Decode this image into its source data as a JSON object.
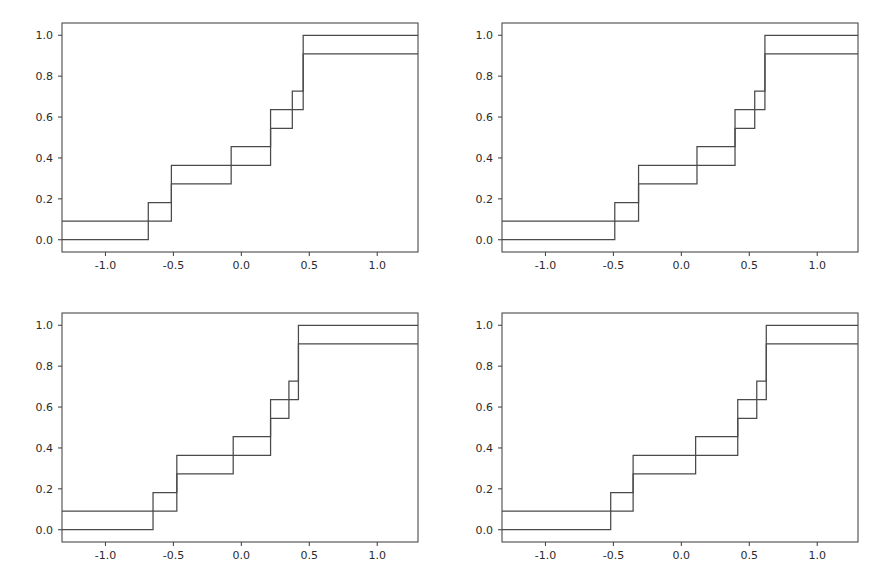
{
  "figure": {
    "background_color": "#ffffff",
    "layout": "2x2 grid of subplots",
    "panel_count": 4
  },
  "chart_data": [
    {
      "type": "line",
      "subtype": "step-ecdf",
      "panel_id": "top-left",
      "panel_position": [
        0,
        0
      ],
      "title": "",
      "xlabel": "",
      "ylabel": "",
      "xlim": [
        -1.32,
        1.3
      ],
      "ylim": [
        -0.06,
        1.06
      ],
      "xticks": [
        -1.0,
        -0.5,
        0.0,
        0.5,
        1.0
      ],
      "xticklabels": [
        "-1.0",
        "-0.5",
        "0.0",
        "0.5",
        "1.0"
      ],
      "yticks": [
        0.0,
        0.2,
        0.4,
        0.6,
        0.8,
        1.0
      ],
      "yticklabels": [
        "0.0",
        "0.2",
        "0.4",
        "0.6",
        "0.8",
        "1.0"
      ],
      "grid": false,
      "legend": "none",
      "series": [
        {
          "name": "ecdf-upper",
          "color": "#4a4a4a",
          "start_value": 0.091,
          "x": [
            -1.32,
            -0.685,
            -0.515,
            -0.075,
            0.215,
            0.375,
            0.455,
            1.3
          ],
          "y": [
            0.091,
            0.182,
            0.273,
            0.455,
            0.545,
            0.727,
            0.909,
            0.909
          ]
        },
        {
          "name": "ecdf-lower",
          "color": "#4a4a4a",
          "start_value": 0.0,
          "x": [
            -1.32,
            -0.685,
            -0.515,
            -0.075,
            0.215,
            0.375,
            0.455,
            1.3
          ],
          "y": [
            0.0,
            0.091,
            0.364,
            0.364,
            0.636,
            0.636,
            1.0,
            1.0
          ]
        }
      ],
      "step_x_positions": [
        -0.685,
        -0.515,
        -0.075,
        0.215,
        0.375,
        0.455
      ],
      "step_y_levels": [
        0.0,
        0.091,
        0.182,
        0.273,
        0.364,
        0.455,
        0.545,
        0.636,
        0.727,
        0.818,
        0.909,
        1.0
      ]
    },
    {
      "type": "line",
      "subtype": "step-ecdf",
      "panel_id": "top-right",
      "panel_position": [
        0,
        1
      ],
      "title": "",
      "xlabel": "",
      "ylabel": "",
      "xlim": [
        -1.32,
        1.3
      ],
      "ylim": [
        -0.06,
        1.06
      ],
      "xticks": [
        -1.0,
        -0.5,
        0.0,
        0.5,
        1.0
      ],
      "xticklabels": [
        "-1.0",
        "-0.5",
        "0.0",
        "0.5",
        "1.0"
      ],
      "yticks": [
        0.0,
        0.2,
        0.4,
        0.6,
        0.8,
        1.0
      ],
      "yticklabels": [
        "0.0",
        "0.2",
        "0.4",
        "0.6",
        "0.8",
        "1.0"
      ],
      "grid": false,
      "legend": "none",
      "series": [
        {
          "name": "ecdf-upper",
          "color": "#4a4a4a",
          "start_value": 0.091,
          "x": [
            -1.32,
            -0.49,
            -0.315,
            0.115,
            0.395,
            0.54,
            0.615,
            1.3
          ],
          "y": [
            0.091,
            0.182,
            0.273,
            0.455,
            0.545,
            0.727,
            0.909,
            0.909
          ]
        },
        {
          "name": "ecdf-lower",
          "color": "#4a4a4a",
          "start_value": 0.0,
          "x": [
            -1.32,
            -0.49,
            -0.315,
            0.115,
            0.395,
            0.54,
            0.615,
            1.3
          ],
          "y": [
            0.0,
            0.091,
            0.364,
            0.364,
            0.636,
            0.636,
            1.0,
            1.0
          ]
        }
      ],
      "step_x_positions": [
        -0.49,
        -0.315,
        0.115,
        0.395,
        0.54,
        0.615
      ],
      "step_y_levels": [
        0.0,
        0.091,
        0.182,
        0.273,
        0.364,
        0.455,
        0.545,
        0.636,
        0.727,
        0.818,
        0.909,
        1.0
      ]
    },
    {
      "type": "line",
      "subtype": "step-ecdf",
      "panel_id": "bottom-left",
      "panel_position": [
        1,
        0
      ],
      "title": "",
      "xlabel": "",
      "ylabel": "",
      "xlim": [
        -1.32,
        1.3
      ],
      "ylim": [
        -0.06,
        1.06
      ],
      "xticks": [
        -1.0,
        -0.5,
        0.0,
        0.5,
        1.0
      ],
      "xticklabels": [
        "-1.0",
        "-0.5",
        "0.0",
        "0.5",
        "1.0"
      ],
      "yticks": [
        0.0,
        0.2,
        0.4,
        0.6,
        0.8,
        1.0
      ],
      "yticklabels": [
        "0.0",
        "0.2",
        "0.4",
        "0.6",
        "0.8",
        "1.0"
      ],
      "grid": false,
      "legend": "none",
      "series": [
        {
          "name": "ecdf-upper",
          "color": "#4a4a4a",
          "start_value": 0.091,
          "x": [
            -1.32,
            -0.65,
            -0.475,
            -0.06,
            0.215,
            0.35,
            0.42,
            1.3
          ],
          "y": [
            0.091,
            0.182,
            0.273,
            0.455,
            0.545,
            0.727,
            0.909,
            0.909
          ]
        },
        {
          "name": "ecdf-lower",
          "color": "#4a4a4a",
          "start_value": 0.0,
          "x": [
            -1.32,
            -0.65,
            -0.475,
            -0.06,
            0.215,
            0.35,
            0.42,
            1.3
          ],
          "y": [
            0.0,
            0.091,
            0.364,
            0.364,
            0.636,
            0.636,
            1.0,
            1.0
          ]
        }
      ],
      "step_x_positions": [
        -0.65,
        -0.475,
        -0.06,
        0.215,
        0.35,
        0.42
      ],
      "step_y_levels": [
        0.0,
        0.091,
        0.182,
        0.273,
        0.364,
        0.455,
        0.545,
        0.636,
        0.727,
        0.818,
        0.909,
        1.0
      ]
    },
    {
      "type": "line",
      "subtype": "step-ecdf",
      "panel_id": "bottom-right",
      "panel_position": [
        1,
        1
      ],
      "title": "",
      "xlabel": "",
      "ylabel": "",
      "xlim": [
        -1.32,
        1.3
      ],
      "ylim": [
        -0.06,
        1.06
      ],
      "xticks": [
        -1.0,
        -0.5,
        0.0,
        0.5,
        1.0
      ],
      "xticklabels": [
        "-1.0",
        "-0.5",
        "0.0",
        "0.5",
        "1.0"
      ],
      "yticks": [
        0.0,
        0.2,
        0.4,
        0.6,
        0.8,
        1.0
      ],
      "yticklabels": [
        "0.0",
        "0.2",
        "0.4",
        "0.6",
        "0.8",
        "1.0"
      ],
      "grid": false,
      "legend": "none",
      "series": [
        {
          "name": "ecdf-upper",
          "color": "#4a4a4a",
          "start_value": 0.091,
          "x": [
            -1.32,
            -0.52,
            -0.355,
            0.105,
            0.415,
            0.555,
            0.625,
            1.3
          ],
          "y": [
            0.091,
            0.182,
            0.273,
            0.455,
            0.545,
            0.727,
            0.909,
            0.909
          ]
        },
        {
          "name": "ecdf-lower",
          "color": "#4a4a4a",
          "start_value": 0.0,
          "x": [
            -1.32,
            -0.52,
            -0.355,
            0.105,
            0.415,
            0.555,
            0.625,
            1.3
          ],
          "y": [
            0.0,
            0.091,
            0.364,
            0.364,
            0.636,
            0.636,
            1.0,
            1.0
          ]
        }
      ],
      "step_x_positions": [
        -0.52,
        -0.355,
        0.105,
        0.415,
        0.555,
        0.625
      ],
      "step_y_levels": [
        0.0,
        0.091,
        0.182,
        0.273,
        0.364,
        0.455,
        0.545,
        0.636,
        0.727,
        0.818,
        0.909,
        1.0
      ]
    }
  ]
}
